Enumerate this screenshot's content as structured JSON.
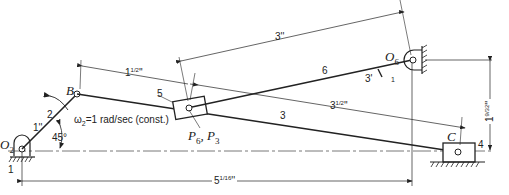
{
  "diagram": {
    "type": "slider-crank / inverted slider mechanism",
    "labels": {
      "O2": "O",
      "O2_sub": "2",
      "O6": "O",
      "O6_sub": "6",
      "B": "B",
      "C": "C",
      "P": "P",
      "P6_sub": "6",
      "P3_sub": "3",
      "link_2": "2",
      "link_3": "3",
      "link_4": "4",
      "link_5": "5",
      "link_6": "6",
      "ground_1_left": "1",
      "ground_1_right": "1",
      "omega": "ω",
      "omega_sub": "2",
      "omega_text": "=1 rad/sec (const.)",
      "angle": "45°"
    },
    "dimensions": {
      "link2_length": "1''",
      "B_to_P_whole": "1",
      "B_to_P_frac": "1/2",
      "B_to_P_unit": "''",
      "P_to_C_whole": "3",
      "P_to_C_frac": "1/2",
      "P_to_C_unit": "''",
      "P_to_O6": "3''",
      "O6_link_label": "3'",
      "O2_to_C_whole": "5",
      "O2_to_C_frac": "1/16",
      "O2_to_C_unit": "''",
      "O6_height_whole": "1",
      "O6_height_frac": "9/32",
      "O6_height_unit": "''"
    },
    "colors": {
      "line": "#222222",
      "background": "#ffffff"
    }
  }
}
